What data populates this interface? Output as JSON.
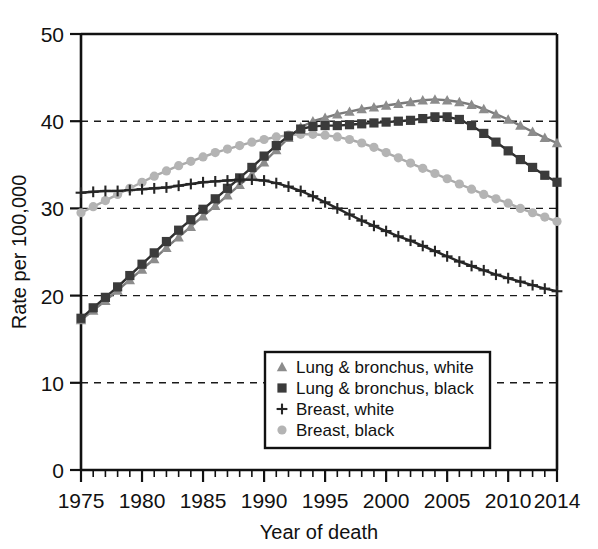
{
  "chart_data": {
    "type": "line",
    "title": "",
    "subtitle": "",
    "xlabel": "Year of death",
    "ylabel": "Rate per 100,000",
    "xlim": [
      1975,
      2014
    ],
    "ylim": [
      0,
      50
    ],
    "xticks": [
      1975,
      1980,
      1985,
      1990,
      1995,
      2000,
      2005,
      2010,
      2014
    ],
    "xtick_labels": [
      "1975",
      "1980",
      "1985",
      "1990",
      "1995",
      "2000",
      "2005",
      "2010",
      "2014"
    ],
    "yticks": [
      0,
      10,
      20,
      30,
      40,
      50
    ],
    "ytick_labels": [
      "0",
      "10",
      "20",
      "30",
      "40",
      "50"
    ],
    "minor_xtick_step": 1,
    "grid": "horizontal-dashed",
    "gridlines": [
      10,
      20,
      30,
      40
    ],
    "legend_position": "bottom-center",
    "x": [
      1975,
      1976,
      1977,
      1978,
      1979,
      1980,
      1981,
      1982,
      1983,
      1984,
      1985,
      1986,
      1987,
      1988,
      1989,
      1990,
      1991,
      1992,
      1993,
      1994,
      1995,
      1996,
      1997,
      1998,
      1999,
      2000,
      2001,
      2002,
      2003,
      2004,
      2005,
      2006,
      2007,
      2008,
      2009,
      2010,
      2011,
      2012,
      2013,
      2014
    ],
    "series": [
      {
        "name": "Lung & bronchus, white",
        "marker": "triangle",
        "color": "#8c8c8c",
        "line_color": "#7a7a7a",
        "values": [
          17.2,
          18.3,
          19.4,
          20.6,
          21.8,
          23.0,
          24.2,
          25.5,
          26.7,
          27.9,
          29.1,
          30.3,
          31.5,
          32.7,
          33.9,
          35.3,
          36.7,
          38.1,
          39.3,
          40.0,
          40.4,
          40.8,
          41.1,
          41.4,
          41.6,
          41.8,
          42.0,
          42.2,
          42.4,
          42.5,
          42.4,
          42.2,
          41.9,
          41.4,
          40.8,
          40.2,
          39.5,
          38.8,
          38.1,
          37.5
        ]
      },
      {
        "name": "Lung & bronchus, black",
        "marker": "square",
        "color": "#3b3b3b",
        "line_color": "#2e2e2e",
        "values": [
          17.4,
          18.6,
          19.8,
          21.0,
          22.3,
          23.6,
          24.9,
          26.2,
          27.5,
          28.7,
          29.9,
          31.1,
          32.3,
          33.5,
          34.7,
          36.0,
          37.2,
          38.3,
          39.1,
          39.4,
          39.5,
          39.5,
          39.6,
          39.7,
          39.8,
          39.9,
          40.0,
          40.1,
          40.3,
          40.5,
          40.5,
          40.2,
          39.5,
          38.6,
          37.6,
          36.6,
          35.6,
          34.7,
          33.8,
          33.0
        ]
      },
      {
        "name": "Breast, white",
        "marker": "plus",
        "color": "#262626",
        "line_color": "#262626",
        "values": [
          31.8,
          31.9,
          32.0,
          32.0,
          32.1,
          32.2,
          32.3,
          32.4,
          32.6,
          32.8,
          33.0,
          33.1,
          33.2,
          33.3,
          33.3,
          33.2,
          32.9,
          32.5,
          32.0,
          31.4,
          30.7,
          30.0,
          29.3,
          28.6,
          28.0,
          27.4,
          26.8,
          26.3,
          25.7,
          25.1,
          24.5,
          23.9,
          23.4,
          22.9,
          22.4,
          22.0,
          21.6,
          21.2,
          20.8,
          20.5
        ]
      },
      {
        "name": "Breast, black",
        "marker": "circle",
        "color": "#b4b4b4",
        "line_color": "#aaaaaa",
        "values": [
          29.5,
          30.2,
          30.9,
          31.6,
          32.3,
          33.0,
          33.7,
          34.3,
          34.9,
          35.4,
          35.9,
          36.4,
          36.8,
          37.2,
          37.6,
          37.9,
          38.2,
          38.4,
          38.5,
          38.5,
          38.4,
          38.2,
          37.9,
          37.5,
          37.0,
          36.4,
          35.8,
          35.2,
          34.6,
          34.0,
          33.4,
          32.8,
          32.2,
          31.6,
          31.1,
          30.6,
          30.0,
          29.5,
          29.0,
          28.5
        ]
      }
    ]
  }
}
